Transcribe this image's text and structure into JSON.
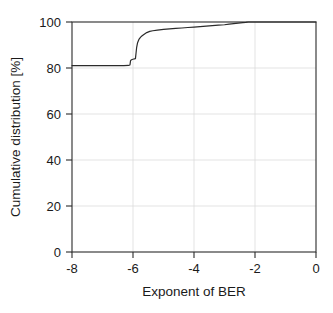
{
  "chart_data": {
    "type": "line",
    "title": "",
    "xlabel": "Exponent of BER",
    "ylabel": "Cumulative distribution [%]",
    "xlim": [
      -8,
      0
    ],
    "ylim": [
      0,
      100
    ],
    "xticks": [
      -8,
      -6,
      -4,
      -2,
      0
    ],
    "xticklabels": [
      "-8",
      "-6",
      "-4",
      "-2",
      "0"
    ],
    "yticks": [
      0,
      20,
      40,
      60,
      80,
      100
    ],
    "yticklabels": [
      "0",
      "20",
      "40",
      "60",
      "80",
      "100"
    ],
    "grid": true,
    "legend": null,
    "series": [
      {
        "name": "Cumulative distribution of BER exponent",
        "x": [
          -8.0,
          -7.5,
          -7.0,
          -6.6,
          -6.3,
          -6.15,
          -6.1,
          -6.08,
          -6.05,
          -6.0,
          -5.95,
          -5.92,
          -5.9,
          -5.88,
          -5.85,
          -5.8,
          -5.75,
          -5.7,
          -5.62,
          -5.55,
          -5.45,
          -5.35,
          -5.2,
          -5.0,
          -4.8,
          -4.6,
          -4.4,
          -4.2,
          -4.0,
          -3.8,
          -3.6,
          -3.4,
          -3.2,
          -3.0,
          -2.85,
          -2.7,
          -2.55,
          -2.4,
          -2.3,
          -2.22,
          -2.1,
          -1.8,
          -1.4,
          -1.0,
          -0.6,
          -0.2,
          0.0
        ],
        "y": [
          81.0,
          81.0,
          81.0,
          81.0,
          81.0,
          81.1,
          81.3,
          83.2,
          83.6,
          83.8,
          84.0,
          84.1,
          86.5,
          89.0,
          91.0,
          92.6,
          93.4,
          94.0,
          94.8,
          95.4,
          95.9,
          96.2,
          96.5,
          96.8,
          97.0,
          97.2,
          97.4,
          97.6,
          97.8,
          98.0,
          98.2,
          98.4,
          98.6,
          98.8,
          99.1,
          99.3,
          99.5,
          99.7,
          99.85,
          100.0,
          100.0,
          100.0,
          100.0,
          100.0,
          100.0,
          100.0,
          100.0
        ]
      }
    ]
  },
  "axes": {
    "x_title": "Exponent of BER",
    "y_title": "Cumulative distribution [%]"
  },
  "colors": {
    "curve": "#2b2b2b",
    "frame": "#2b2b2b",
    "grid": "#dcdcdc",
    "background": "#ffffff",
    "text": "#1a1a1a"
  }
}
